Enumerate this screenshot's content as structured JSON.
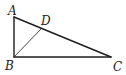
{
  "diagram": {
    "type": "geometry-triangle",
    "points": {
      "A": {
        "label": "A",
        "x": 14,
        "y": 17,
        "label_x": 8,
        "label_y": 15
      },
      "B": {
        "label": "B",
        "x": 14,
        "y": 57,
        "label_x": 5,
        "label_y": 70
      },
      "C": {
        "label": "C",
        "x": 111,
        "y": 57,
        "label_x": 113,
        "label_y": 71
      },
      "D": {
        "label": "D",
        "x": 41,
        "y": 29,
        "label_x": 41,
        "label_y": 25
      }
    },
    "segments": [
      "AB",
      "BC",
      "AC",
      "BD"
    ],
    "colors": {
      "stroke": "#1e1e1e",
      "background": "#ffffff"
    }
  }
}
